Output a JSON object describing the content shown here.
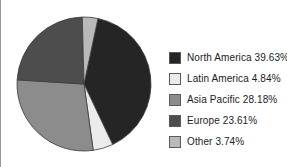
{
  "chart_data": {
    "type": "pie",
    "title": "",
    "categories": [
      "North America",
      "Latin America",
      "Asia Pacific",
      "Europe",
      "Other"
    ],
    "values": [
      39.63,
      4.84,
      28.18,
      23.61,
      3.74
    ],
    "value_unit": "%",
    "colors": [
      "#252525",
      "#ebebeb",
      "#8c8c8c",
      "#4d4d4d",
      "#b9b9b9"
    ],
    "legend_position": "right",
    "grid": false,
    "start_angle_deg": 12,
    "direction": "clockwise",
    "slice_outline": "#3a3a3a",
    "legend": [
      {
        "label": "North America 39.63%",
        "name": "North America",
        "value": 39.63,
        "color": "#252525"
      },
      {
        "label": "Latin America 4.84%",
        "name": "Latin America",
        "value": 4.84,
        "color": "#ebebeb"
      },
      {
        "label": "Asia Pacific 28.18%",
        "name": "Asia Pacific",
        "value": 28.18,
        "color": "#8c8c8c"
      },
      {
        "label": "Europe 23.61%",
        "name": "Europe",
        "value": 23.61,
        "color": "#4d4d4d"
      },
      {
        "label": "Other 3.74%",
        "name": "Other",
        "value": 3.74,
        "color": "#b9b9b9"
      }
    ]
  }
}
